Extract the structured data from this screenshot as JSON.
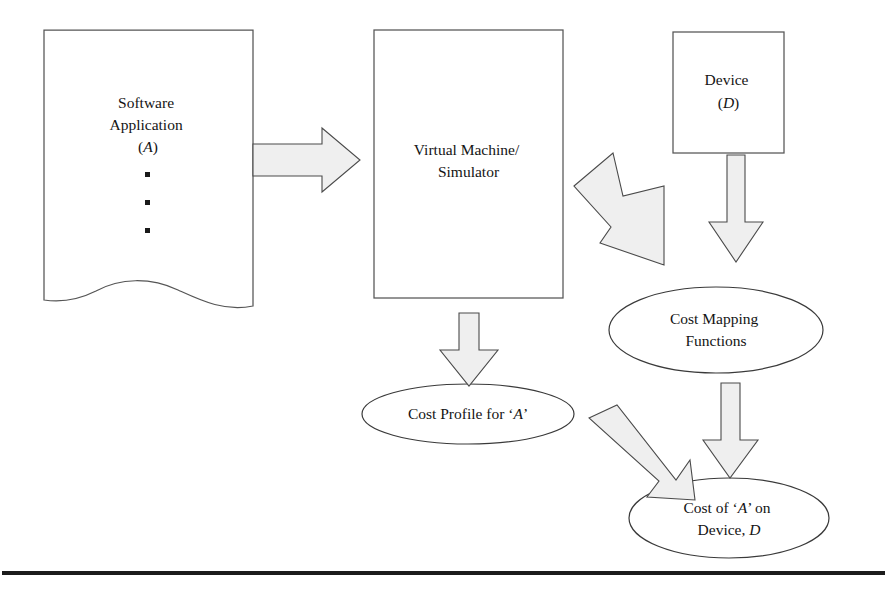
{
  "figure": {
    "background_color": "#ffffff",
    "width": 889,
    "height": 593
  },
  "nodes": {
    "software_application": {
      "line1": "Software",
      "line2": "Application",
      "line3": "(A)",
      "symbol": "A",
      "shape": "document",
      "ellipsis": "•",
      "ellipsis_count": 3
    },
    "virtual_machine": {
      "line1": "Virtual Machine/",
      "line2": "Simulator",
      "shape": "rectangle"
    },
    "device": {
      "line1": "Device",
      "line2": "(D)",
      "symbol": "D",
      "shape": "rectangle"
    },
    "cost_mapping_functions": {
      "line1": "Cost Mapping",
      "line2": "Functions",
      "shape": "ellipse"
    },
    "cost_profile": {
      "prefix": "Cost Profile for ‘",
      "symbol": "A",
      "suffix": "’",
      "shape": "ellipse"
    },
    "cost_of_a_on_device": {
      "line1_prefix": "Cost of ‘",
      "line1_symbol": "A",
      "line1_suffix": "’ on",
      "line2_prefix": "Device, ",
      "line2_symbol": "D",
      "shape": "ellipse"
    }
  },
  "arrows": [
    {
      "id": "app-to-vm",
      "from": "software_application",
      "to": "virtual_machine",
      "direction": "right"
    },
    {
      "id": "vm-to-cost-mapping",
      "from": "virtual_machine",
      "to": "cost_mapping_functions",
      "direction": "down-right"
    },
    {
      "id": "device-to-cost-mapping",
      "from": "device",
      "to": "cost_mapping_functions",
      "direction": "down"
    },
    {
      "id": "vm-to-cost-profile",
      "from": "virtual_machine",
      "to": "cost_profile",
      "direction": "down"
    },
    {
      "id": "cost-profile-to-result",
      "from": "cost_profile",
      "to": "cost_of_a_on_device",
      "direction": "down-right"
    },
    {
      "id": "cost-mapping-to-result",
      "from": "cost_mapping_functions",
      "to": "cost_of_a_on_device",
      "direction": "down"
    }
  ],
  "colors": {
    "arrow_fill": "#efefef",
    "arrow_stroke": "#4a4a4a",
    "shape_stroke": "#555555",
    "ellipse_stroke": "#3a3a3a",
    "text": "#141414",
    "rule": "#1c1c1c"
  }
}
